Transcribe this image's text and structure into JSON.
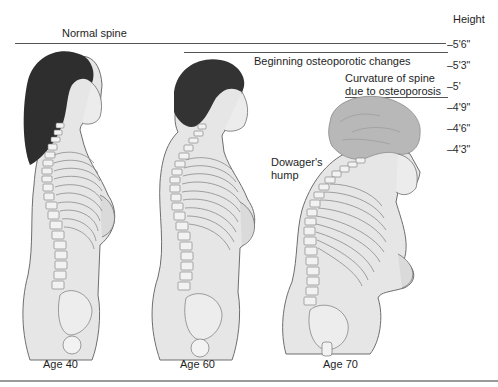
{
  "height_scale": {
    "title": "Height",
    "ticks": [
      "–5'6\"",
      "–5'3\"",
      "–5'",
      "–4'9\"",
      "–4'6\"",
      "–4'3\""
    ]
  },
  "annotations": {
    "normal_spine": "Normal spine",
    "beginning_changes": "Beginning osteoporotic changes",
    "curvature_line1": "Curvature of spine",
    "curvature_line2": "due to osteoporosis",
    "dowager_line1": "Dowager's",
    "dowager_line2": "hump"
  },
  "figures": [
    {
      "age_label": "Age 40",
      "height": "5'6\"",
      "description": "Normal spine"
    },
    {
      "age_label": "Age 60",
      "height": "5'3\"",
      "description": "Beginning osteoporotic changes"
    },
    {
      "age_label": "Age 70",
      "height": "5'",
      "description": "Curvature of spine due to osteoporosis, Dowager's hump"
    }
  ],
  "colors": {
    "skin": "#e6e6e6",
    "skin_shadow": "#c8c8c8",
    "hair_dark": "#2e2e2e",
    "hair_gray": "#b5b5b5",
    "bone": "#f2f2f2",
    "outline": "#6e6e6e"
  }
}
